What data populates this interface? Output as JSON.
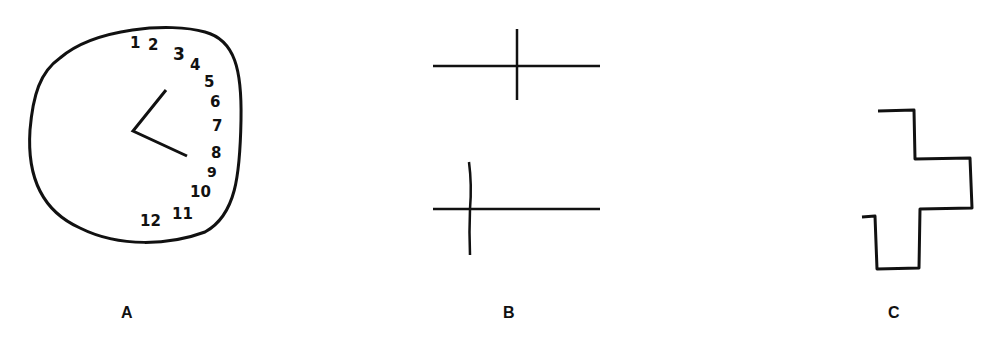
{
  "panels": [
    {
      "id": "A",
      "label": "A",
      "description": "Hand-drawn clock with all numbers crowded on the right side",
      "clock_numbers": [
        "1",
        "2",
        "3",
        "4",
        "5",
        "6",
        "7",
        "8",
        "9",
        "10",
        "11",
        "12"
      ]
    },
    {
      "id": "B",
      "label": "B",
      "description": "Line bisection: top line bisected at center, bottom line marked far left"
    },
    {
      "id": "C",
      "label": "C",
      "description": "Copy of a cross drawn with only the right half"
    }
  ],
  "colors": {
    "ink": "#111111",
    "background": "#ffffff"
  }
}
